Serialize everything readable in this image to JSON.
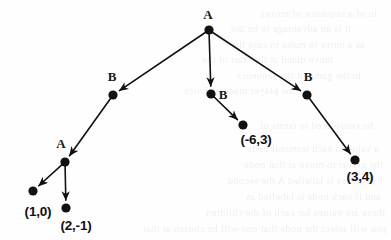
{
  "figure": {
    "type": "game-tree-diagram",
    "background_color": "#fefefe",
    "ink_color": "#111111",
    "node_radius": 4.6,
    "edge_width": 1.6
  },
  "nodes": [
    {
      "id": "root",
      "label": "A",
      "kind": "internal",
      "x": 209,
      "y": 30,
      "label_x": 208,
      "label_y": 15,
      "label_pos": "above"
    },
    {
      "id": "b1",
      "label": "B",
      "kind": "internal",
      "x": 113,
      "y": 95,
      "label_x": 112,
      "label_y": 77,
      "label_pos": "above"
    },
    {
      "id": "b2",
      "label": "B",
      "kind": "internal",
      "x": 211,
      "y": 94,
      "label_x": 223,
      "label_y": 95,
      "label_pos": "right"
    },
    {
      "id": "b3",
      "label": "B",
      "kind": "internal",
      "x": 307,
      "y": 95,
      "label_x": 308,
      "label_y": 77,
      "label_pos": "above"
    },
    {
      "id": "a2",
      "label": "A",
      "kind": "internal",
      "x": 65,
      "y": 162,
      "label_x": 61,
      "label_y": 144,
      "label_pos": "above"
    },
    {
      "id": "leaf1",
      "label": "(1,0)",
      "kind": "leaf",
      "x": 33,
      "y": 191,
      "label_x": 38,
      "label_y": 211,
      "label_pos": "below"
    },
    {
      "id": "leaf2",
      "label": "(2,-1)",
      "kind": "leaf",
      "x": 66,
      "y": 208,
      "label_x": 76,
      "label_y": 225,
      "label_pos": "below"
    },
    {
      "id": "leaf3",
      "label": "(-6,3)",
      "kind": "leaf",
      "x": 243,
      "y": 125,
      "label_x": 256,
      "label_y": 139,
      "label_pos": "below"
    },
    {
      "id": "leaf4",
      "label": "(3,4)",
      "kind": "leaf",
      "x": 355,
      "y": 160,
      "label_x": 360,
      "label_y": 176,
      "label_pos": "below"
    }
  ],
  "edges": [
    {
      "id": "e-root-b1",
      "from": "root",
      "to": "b1",
      "arrow": true
    },
    {
      "id": "e-root-b2",
      "from": "root",
      "to": "b2",
      "arrow": true
    },
    {
      "id": "e-root-b3",
      "from": "root",
      "to": "b3",
      "arrow": true
    },
    {
      "id": "e-b1-a2",
      "from": "b1",
      "to": "a2",
      "arrow": true
    },
    {
      "id": "e-b2-l3",
      "from": "b2",
      "to": "leaf3",
      "arrow": true
    },
    {
      "id": "e-b3-l4",
      "from": "b3",
      "to": "leaf4",
      "arrow": true
    },
    {
      "id": "e-a2-l1",
      "from": "a2",
      "to": "leaf1",
      "arrow": true
    },
    {
      "id": "e-a2-l2",
      "from": "a2",
      "to": "leaf2",
      "arrow": true
    }
  ],
  "background_ghost_text": [
    {
      "text": "in of a sequence of moves",
      "x": 14,
      "y": 6
    },
    {
      "text": "it is an advantage to be the",
      "x": 40,
      "y": 21
    },
    {
      "text": "as a move to make in case the",
      "x": 26,
      "y": 37
    },
    {
      "text": "move mand at the start of the",
      "x": 58,
      "y": 52
    },
    {
      "text": "in the game of the sequence",
      "x": 30,
      "y": 68
    },
    {
      "text": "the player made a choice",
      "x": 96,
      "y": 83
    },
    {
      "text": "be considered in terms of",
      "x": 18,
      "y": 118
    },
    {
      "text": "a value to each terminal node",
      "x": 12,
      "y": 141
    },
    {
      "text": "the player to move at that node",
      "x": 8,
      "y": 157
    },
    {
      "text": "of nodes is labelled A the second",
      "x": 16,
      "y": 173
    },
    {
      "text": "and if each node is labelled as",
      "x": 10,
      "y": 189
    },
    {
      "text": "these are values for each of the children",
      "x": 6,
      "y": 205
    },
    {
      "text": "you will select the node that one will be chosen at that",
      "x": 4,
      "y": 221
    }
  ]
}
